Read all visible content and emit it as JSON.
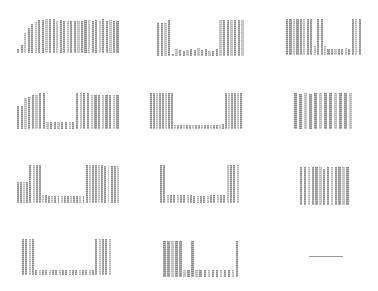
{
  "chart_data": [
    {
      "type": "bar",
      "panel": "r1c1",
      "box": [
        17,
        17,
        103,
        36
      ],
      "values": [
        10,
        22,
        55,
        70,
        80,
        85,
        92,
        92,
        95,
        95,
        94,
        88,
        92,
        90,
        88,
        90,
        90,
        89,
        90,
        91,
        92,
        90,
        93,
        89,
        94,
        90,
        92,
        89,
        88
      ]
    },
    {
      "type": "bar",
      "panel": "r1c2",
      "box": [
        157,
        20,
        88,
        36
      ],
      "values": [
        92,
        92,
        92,
        100,
        5,
        20,
        18,
        15,
        18,
        20,
        18,
        22,
        18,
        20,
        15,
        15,
        20,
        100,
        100,
        100,
        100,
        100,
        100,
        100
      ]
    },
    {
      "type": "bar",
      "panel": "r1c3",
      "box": [
        286,
        19,
        76,
        36
      ],
      "values": [
        100,
        100,
        100,
        100,
        100,
        100,
        100,
        100,
        25,
        100,
        100,
        25,
        18,
        18,
        18,
        18,
        18,
        20,
        18,
        100,
        100,
        100
      ]
    },
    {
      "type": "bar",
      "panel": "r2c1",
      "box": [
        17,
        93,
        103,
        36
      ],
      "values": [
        65,
        65,
        85,
        90,
        95,
        95,
        100,
        100,
        20,
        20,
        20,
        20,
        20,
        20,
        20,
        20,
        100,
        100,
        100,
        100,
        95,
        95,
        95,
        95,
        95,
        95,
        95,
        95
      ]
    },
    {
      "type": "bar",
      "panel": "r2c2",
      "box": [
        150,
        93,
        93,
        36
      ],
      "values": [
        100,
        100,
        100,
        100,
        100,
        100,
        100,
        100,
        12,
        10,
        12,
        10,
        12,
        10,
        12,
        10,
        12,
        10,
        12,
        10,
        12,
        10,
        12,
        12,
        15,
        100,
        100,
        100,
        100,
        100,
        100
      ]
    },
    {
      "type": "bar",
      "panel": "r2c3",
      "box": [
        294,
        93,
        60,
        36
      ],
      "values": [
        100,
        98,
        100,
        98,
        100,
        100,
        100,
        100,
        100,
        100,
        100,
        100
      ]
    },
    {
      "type": "bar",
      "panel": "r3c1",
      "box": [
        17,
        165,
        103,
        38
      ],
      "values": [
        55,
        55,
        55,
        55,
        100,
        100,
        100,
        100,
        20,
        20,
        18,
        18,
        18,
        18,
        18,
        18,
        18,
        18,
        18,
        18,
        18,
        18,
        100,
        100,
        100,
        100,
        100,
        100,
        98,
        98,
        98,
        98,
        98
      ]
    },
    {
      "type": "bar",
      "panel": "r3c2",
      "box": [
        160,
        165,
        80,
        38
      ],
      "values": [
        100,
        100,
        22,
        20,
        20,
        20,
        20,
        20,
        20,
        20,
        18,
        18,
        18,
        18,
        18,
        20,
        20,
        20,
        20,
        20,
        100,
        100,
        100,
        100
      ]
    },
    {
      "type": "bar",
      "panel": "r3c3",
      "box": [
        300,
        167,
        50,
        38
      ],
      "values": [
        100,
        100,
        100,
        100,
        100,
        100,
        95,
        100,
        100,
        100,
        100,
        100,
        100
      ]
    },
    {
      "type": "bar",
      "panel": "r4c1",
      "box": [
        22,
        239,
        90,
        36
      ],
      "values": [
        100,
        100,
        100,
        100,
        15,
        15,
        15,
        15,
        15,
        15,
        15,
        15,
        15,
        15,
        15,
        15,
        15,
        15,
        15,
        15,
        15,
        15,
        100,
        100,
        100,
        100,
        100
      ]
    },
    {
      "type": "bar",
      "panel": "r4c2",
      "box": [
        163,
        241,
        77,
        36
      ],
      "values": [
        100,
        100,
        100,
        100,
        100,
        20,
        20,
        100,
        20,
        20,
        20,
        20,
        20,
        20,
        20,
        20,
        20,
        20,
        100
      ]
    },
    {
      "type": "line",
      "panel": "r4c3",
      "box": [
        309,
        256,
        34,
        1
      ],
      "values": [
        0
      ]
    }
  ]
}
